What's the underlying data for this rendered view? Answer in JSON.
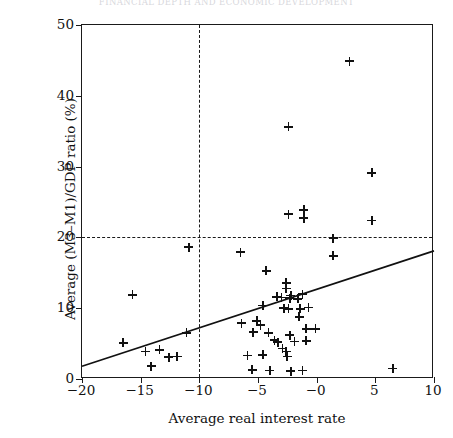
{
  "figure": {
    "running_title": "FINANCIAL DEPTH AND ECONOMIC DEVELOPMENT",
    "background": "#ffffff",
    "ink": "#111111"
  },
  "chart_data": {
    "type": "scatter",
    "title": "",
    "xlabel": "Average real interest rate",
    "ylabel": "Average (M3–M1)/GDP ratio (%)",
    "xlim": [
      -20,
      10
    ],
    "ylim": [
      0,
      50
    ],
    "xticks": [
      -20,
      -15,
      -10,
      -5,
      0,
      5,
      10
    ],
    "xticklabels": [
      "−20",
      "−15",
      "−10",
      "−5",
      "−0",
      "5",
      "10"
    ],
    "yticks": [
      0,
      10,
      20,
      30,
      40,
      50
    ],
    "yticklabels": [
      "0",
      "10",
      "20",
      "30",
      "40",
      "50"
    ],
    "grid": false,
    "legend": null,
    "marker": "plus",
    "reference_lines": [
      {
        "orientation": "vertical",
        "value": -10,
        "style": "dashed"
      },
      {
        "orientation": "horizontal",
        "value": 20,
        "style": "dashed"
      }
    ],
    "trend_line": {
      "style": "solid",
      "x": [
        -20,
        10
      ],
      "y": [
        1.8,
        18.1
      ]
    },
    "points": [
      {
        "x": 2.8,
        "y": 44.9
      },
      {
        "x": -2.4,
        "y": 35.6
      },
      {
        "x": 4.7,
        "y": 29.1
      },
      {
        "x": -2.4,
        "y": 23.3
      },
      {
        "x": -1.1,
        "y": 23.9
      },
      {
        "x": -1.1,
        "y": 22.7
      },
      {
        "x": 4.7,
        "y": 22.4
      },
      {
        "x": 1.4,
        "y": 19.9
      },
      {
        "x": 1.4,
        "y": 17.4
      },
      {
        "x": -10.9,
        "y": 18.6
      },
      {
        "x": -6.5,
        "y": 17.9
      },
      {
        "x": -4.3,
        "y": 15.3
      },
      {
        "x": -2.6,
        "y": 13.6
      },
      {
        "x": -2.6,
        "y": 12.8
      },
      {
        "x": -15.7,
        "y": 11.9
      },
      {
        "x": -3.4,
        "y": 11.6
      },
      {
        "x": -3.0,
        "y": 11.5
      },
      {
        "x": -2.3,
        "y": 11.4
      },
      {
        "x": -2.2,
        "y": 11.8
      },
      {
        "x": -1.6,
        "y": 11.3
      },
      {
        "x": -1.2,
        "y": 12.0
      },
      {
        "x": -4.6,
        "y": 10.4
      },
      {
        "x": -2.8,
        "y": 10.0
      },
      {
        "x": -2.4,
        "y": 9.9
      },
      {
        "x": -1.4,
        "y": 9.9
      },
      {
        "x": -1.5,
        "y": 8.8
      },
      {
        "x": -0.7,
        "y": 10.1
      },
      {
        "x": -5.1,
        "y": 8.2
      },
      {
        "x": -4.8,
        "y": 7.6
      },
      {
        "x": -6.4,
        "y": 7.9
      },
      {
        "x": -11.1,
        "y": 6.5
      },
      {
        "x": -13.4,
        "y": 4.1
      },
      {
        "x": -16.5,
        "y": 5.1
      },
      {
        "x": -14.6,
        "y": 3.9
      },
      {
        "x": -14.1,
        "y": 1.8
      },
      {
        "x": -12.6,
        "y": 3.1
      },
      {
        "x": -11.9,
        "y": 3.2
      },
      {
        "x": -5.4,
        "y": 6.6
      },
      {
        "x": -4.1,
        "y": 6.5
      },
      {
        "x": -3.6,
        "y": 5.5
      },
      {
        "x": -3.3,
        "y": 5.2
      },
      {
        "x": -2.3,
        "y": 6.2
      },
      {
        "x": -2.9,
        "y": 4.3
      },
      {
        "x": -2.6,
        "y": 3.9
      },
      {
        "x": -2.5,
        "y": 3.2
      },
      {
        "x": -1.9,
        "y": 5.3
      },
      {
        "x": -0.9,
        "y": 7.1
      },
      {
        "x": -0.9,
        "y": 5.4
      },
      {
        "x": -0.1,
        "y": 7.1
      },
      {
        "x": -5.9,
        "y": 3.3
      },
      {
        "x": -4.6,
        "y": 3.4
      },
      {
        "x": -5.5,
        "y": 1.3
      },
      {
        "x": -4.0,
        "y": 1.2
      },
      {
        "x": -2.2,
        "y": 1.1
      },
      {
        "x": -1.2,
        "y": 1.2
      },
      {
        "x": 6.5,
        "y": 1.5
      }
    ]
  }
}
